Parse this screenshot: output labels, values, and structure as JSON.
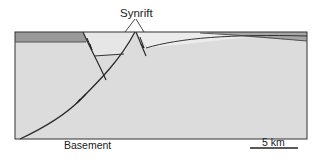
{
  "figure": {
    "type": "geological cross-section",
    "labels": {
      "synrift": "Synrift",
      "basement": "Basement",
      "scale": "5 km"
    },
    "units": [
      {
        "name": "prerift-layer",
        "color": "#9a9a9a"
      },
      {
        "name": "synrift-wedge",
        "color": "#d8d8d8"
      },
      {
        "name": "basement",
        "color": "#dcdcdc"
      }
    ],
    "colors": {
      "outline": "#333333",
      "fault_line": "#2a2a2a",
      "background": "#ffffff"
    }
  }
}
